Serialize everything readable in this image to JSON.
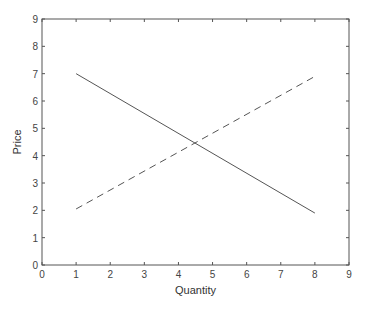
{
  "chart_data": {
    "type": "line",
    "title": "",
    "xlabel": "Quantity",
    "ylabel": "Price",
    "xlim": [
      0,
      9
    ],
    "ylim": [
      0,
      9
    ],
    "xticks": [
      0,
      1,
      2,
      3,
      4,
      5,
      6,
      7,
      8,
      9
    ],
    "yticks": [
      0,
      1,
      2,
      3,
      4,
      5,
      6,
      7,
      8,
      9
    ],
    "grid": false,
    "legend": null,
    "series": [
      {
        "name": "demand",
        "style": "solid",
        "color": "#555555",
        "x": [
          1,
          8
        ],
        "y": [
          7,
          1.9
        ]
      },
      {
        "name": "supply",
        "style": "dashed",
        "color": "#555555",
        "x": [
          1,
          8
        ],
        "y": [
          2.05,
          6.9
        ]
      }
    ],
    "annotations": []
  },
  "layout": {
    "plot_left": 42,
    "plot_right": 349,
    "plot_top": 19,
    "plot_bottom": 265,
    "axis_color": "#555555"
  }
}
